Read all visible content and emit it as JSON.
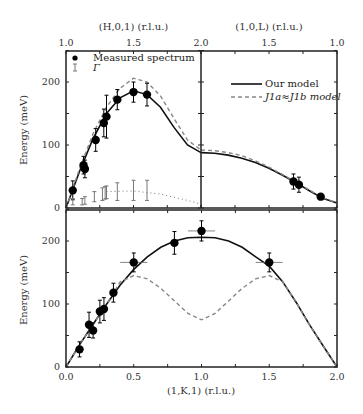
{
  "chart_data": [
    {
      "type": "scatter",
      "panel": "upper-left",
      "xlabel": "(H,0,1) (r.l.u.)",
      "ylabel": "Energy (meV)",
      "xlim": [
        1.0,
        2.0
      ],
      "ylim": [
        0,
        250
      ],
      "x_ticks": [
        "1.0",
        "1.5",
        "2.0"
      ],
      "y_ticks": [
        "0",
        "100",
        "200"
      ],
      "legend": [
        "Measured spectrum",
        "Γ"
      ],
      "series": [
        {
          "name": "Measured spectrum",
          "marker": "filled-circle",
          "color": "#000000",
          "x": [
            1.05,
            1.13,
            1.14,
            1.22,
            1.28,
            1.3,
            1.38,
            1.5,
            1.6
          ],
          "y": [
            28,
            68,
            62,
            108,
            135,
            145,
            172,
            184,
            180
          ],
          "yerr": [
            15,
            14,
            14,
            18,
            22,
            34,
            16,
            16,
            18
          ]
        },
        {
          "name": "Γ",
          "marker": "errorbar",
          "color": "#777777",
          "x": [
            1.05,
            1.12,
            1.14,
            1.21,
            1.27,
            1.29,
            1.3,
            1.38,
            1.5,
            1.6
          ],
          "y": [
            10,
            10,
            12,
            18,
            22,
            24,
            25,
            26,
            28,
            28
          ],
          "yerr": [
            5,
            5,
            6,
            8,
            10,
            10,
            10,
            14,
            16,
            16
          ]
        },
        {
          "name": "Γ trend",
          "style": "dotted",
          "color": "#777777",
          "x": [
            1.3,
            1.5,
            1.7,
            1.9,
            2.0
          ],
          "y": [
            26,
            27,
            22,
            12,
            6
          ]
        },
        {
          "name": "Our model",
          "style": "solid",
          "color": "#111111",
          "x": [
            1.0,
            1.1,
            1.2,
            1.3,
            1.4,
            1.5,
            1.6,
            1.7,
            1.8,
            1.9,
            2.0
          ],
          "y": [
            0,
            58,
            110,
            150,
            175,
            186,
            180,
            160,
            128,
            100,
            88
          ]
        },
        {
          "name": "J1a≈J1b model",
          "style": "dashed",
          "color": "#888888",
          "x": [
            1.0,
            1.1,
            1.2,
            1.3,
            1.4,
            1.5,
            1.6,
            1.7,
            1.8,
            1.9,
            2.0
          ],
          "y": [
            0,
            62,
            118,
            160,
            190,
            206,
            200,
            178,
            142,
            108,
            92
          ]
        }
      ]
    },
    {
      "type": "scatter",
      "panel": "upper-right",
      "xlabel": "(1,0,L) (r.l.u.)",
      "xlim": [
        2.0,
        1.0
      ],
      "ylim": [
        0,
        250
      ],
      "x_ticks": [
        "2.0",
        "1.5",
        "1.0"
      ],
      "legend": [
        "Our model",
        "J1a≈J1b model"
      ],
      "series": [
        {
          "name": "Measured spectrum",
          "marker": "filled-circle",
          "color": "#000000",
          "x": [
            1.32,
            1.28,
            1.12
          ],
          "y": [
            42,
            37,
            18
          ],
          "yerr": [
            12,
            12,
            4
          ]
        },
        {
          "name": "Our model",
          "style": "solid",
          "color": "#111111",
          "x": [
            2.0,
            1.9,
            1.8,
            1.7,
            1.6,
            1.5,
            1.4,
            1.3,
            1.2,
            1.1,
            1.0
          ],
          "y": [
            88,
            87,
            84,
            79,
            72,
            63,
            52,
            40,
            27,
            15,
            8
          ]
        },
        {
          "name": "J1a≈J1b model",
          "style": "dashed",
          "color": "#888888",
          "x": [
            2.0,
            1.9,
            1.8,
            1.7,
            1.6,
            1.5,
            1.4,
            1.3,
            1.2,
            1.1,
            1.0
          ],
          "y": [
            92,
            91,
            88,
            83,
            75,
            65,
            53,
            41,
            28,
            16,
            8
          ]
        }
      ]
    },
    {
      "type": "scatter",
      "panel": "lower",
      "xlabel": "(1,K,1) (r.l.u.)",
      "ylabel": "Energy (meV)",
      "xlim": [
        0.0,
        2.0
      ],
      "ylim": [
        0,
        250
      ],
      "x_ticks": [
        "0.0",
        "0.5",
        "1.0",
        "1.5",
        "2.0"
      ],
      "y_ticks": [
        "0",
        "100",
        "200"
      ],
      "series": [
        {
          "name": "Measured spectrum",
          "marker": "filled-circle",
          "color": "#000000",
          "x": [
            0.1,
            0.17,
            0.2,
            0.25,
            0.28,
            0.35,
            0.5,
            0.8,
            1.0,
            1.5
          ],
          "y": [
            28,
            67,
            58,
            88,
            92,
            118,
            166,
            197,
            216,
            166
          ],
          "yerr": [
            12,
            20,
            12,
            18,
            18,
            15,
            15,
            18,
            16,
            15
          ],
          "xerr": [
            0,
            0,
            0,
            0,
            0,
            0,
            0.1,
            0,
            0.1,
            0.1
          ]
        },
        {
          "name": "Our model",
          "style": "solid",
          "color": "#111111",
          "x": [
            0.0,
            0.1,
            0.2,
            0.3,
            0.4,
            0.5,
            0.6,
            0.7,
            0.8,
            0.9,
            1.0,
            1.1,
            1.2,
            1.3,
            1.4,
            1.5,
            1.6,
            1.7,
            1.8,
            1.9,
            2.0
          ],
          "y": [
            0,
            35,
            68,
            100,
            130,
            155,
            175,
            190,
            200,
            205,
            206,
            205,
            200,
            190,
            175,
            160,
            135,
            102,
            66,
            33,
            0
          ]
        },
        {
          "name": "J1a≈J1b model",
          "style": "dashed",
          "color": "#888888",
          "x": [
            0.0,
            0.1,
            0.2,
            0.3,
            0.4,
            0.5,
            0.6,
            0.7,
            0.8,
            0.9,
            1.0,
            1.1,
            1.2,
            1.3,
            1.4,
            1.5,
            1.6,
            1.7,
            1.8,
            1.9,
            2.0
          ],
          "y": [
            0,
            35,
            68,
            100,
            135,
            145,
            140,
            125,
            105,
            85,
            75,
            85,
            105,
            125,
            140,
            145,
            135,
            102,
            66,
            33,
            0
          ]
        }
      ]
    }
  ],
  "labels": {
    "top_left_axis_title": "(H,0,1) (r.l.u.)",
    "top_right_axis_title": "(1,0,L) (r.l.u.)",
    "bottom_axis_title": "(1,K,1) (r.l.u.)",
    "y_axis_title": "Energy (meV)",
    "top_ticks": [
      "1.0",
      "1.5",
      "2.0",
      "1.5",
      "1.0"
    ],
    "bottom_ticks": [
      "0.0",
      "0.5",
      "1.0",
      "1.5",
      "2.0"
    ],
    "y_ticks": [
      "0",
      "100",
      "200"
    ],
    "legend_measured": "Measured spectrum",
    "legend_gamma": "Γ",
    "legend_our_model": "Our model",
    "legend_alt_model": "J1a≈J1b model"
  }
}
